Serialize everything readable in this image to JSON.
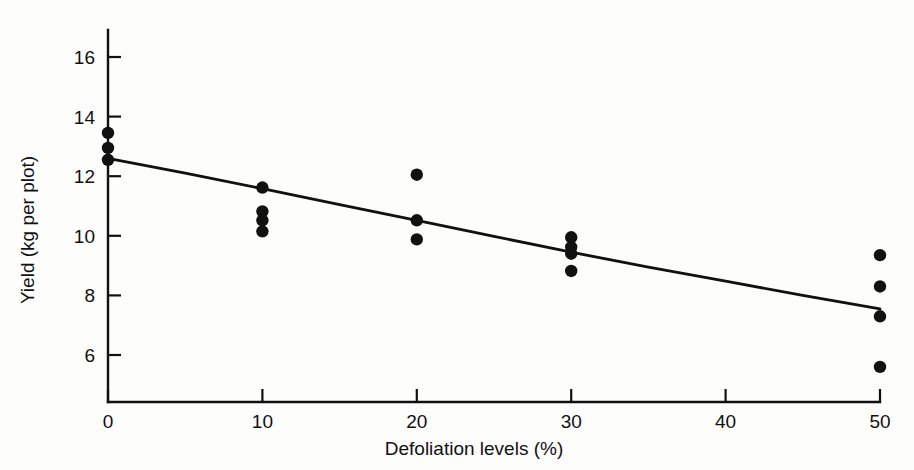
{
  "chart_data": {
    "type": "scatter",
    "title": "",
    "xlabel": "Defoliation levels (%)",
    "ylabel": "Yield (kg per plot)",
    "xlim": [
      0,
      52
    ],
    "ylim": [
      5.2,
      16.8
    ],
    "grid": false,
    "legend": "none",
    "xticks": [
      0,
      10,
      20,
      30,
      40,
      50
    ],
    "xtick_labels": [
      "0",
      "10",
      "20",
      "30",
      "40",
      "50"
    ],
    "yticks": [
      6,
      8,
      10,
      12,
      14,
      16
    ],
    "ytick_labels": [
      "6",
      "8",
      "10",
      "12",
      "14",
      "16"
    ],
    "series": [
      {
        "name": "Observed yield",
        "marker": "filled-circle",
        "color": "#111111",
        "points": [
          {
            "x": 0,
            "y": 13.45
          },
          {
            "x": 0,
            "y": 12.95
          },
          {
            "x": 0,
            "y": 12.55
          },
          {
            "x": 10,
            "y": 11.62
          },
          {
            "x": 10,
            "y": 10.82
          },
          {
            "x": 10,
            "y": 10.52
          },
          {
            "x": 10,
            "y": 10.15
          },
          {
            "x": 20,
            "y": 12.05
          },
          {
            "x": 20,
            "y": 10.52
          },
          {
            "x": 20,
            "y": 9.88
          },
          {
            "x": 30,
            "y": 9.95
          },
          {
            "x": 30,
            "y": 9.62
          },
          {
            "x": 30,
            "y": 9.4
          },
          {
            "x": 30,
            "y": 8.82
          },
          {
            "x": 50,
            "y": 9.35
          },
          {
            "x": 50,
            "y": 8.3
          },
          {
            "x": 50,
            "y": 7.3
          },
          {
            "x": 50,
            "y": 5.6
          }
        ]
      }
    ],
    "fitted_curve": {
      "name": "Fitted regression line",
      "color": "#111111",
      "points": [
        {
          "x": 0,
          "y": 12.6
        },
        {
          "x": 5,
          "y": 12.1
        },
        {
          "x": 10,
          "y": 11.58
        },
        {
          "x": 15,
          "y": 11.05
        },
        {
          "x": 20,
          "y": 10.52
        },
        {
          "x": 25,
          "y": 9.98
        },
        {
          "x": 30,
          "y": 9.45
        },
        {
          "x": 35,
          "y": 8.95
        },
        {
          "x": 40,
          "y": 8.48
        },
        {
          "x": 45,
          "y": 8.0
        },
        {
          "x": 50,
          "y": 7.55
        }
      ]
    }
  },
  "colors": {
    "ink": "#111111",
    "background": "#fdfdfb"
  }
}
